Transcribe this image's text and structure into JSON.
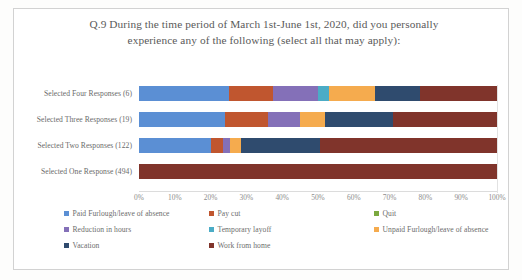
{
  "chart_data": {
    "type": "bar",
    "orientation": "horizontal",
    "stacked": true,
    "normalized_percent": true,
    "title": "Q.9 During the time period of March 1st-June 1st, 2020, did you personally experience any of the following (select all that may apply):",
    "xlabel": "",
    "ylabel": "",
    "xlim": [
      0,
      100
    ],
    "grid": false,
    "legend_position": "bottom",
    "xtick_labels": [
      "0%",
      "10%",
      "20%",
      "30%",
      "40%",
      "50%",
      "60%",
      "70%",
      "80%",
      "90%",
      "100%"
    ],
    "xtick_values": [
      0,
      10,
      20,
      30,
      40,
      50,
      60,
      70,
      80,
      90,
      100
    ],
    "categories": [
      "Selected Four Responses (6)",
      "Selected Three Responses (19)",
      "Selected Two Responses (122)",
      "Selected One Response (494)"
    ],
    "series": [
      {
        "name": "Paid Furlough/leave of absence",
        "color": "#5b8fd4",
        "values": [
          25.0,
          24.0,
          20.0,
          0.0
        ]
      },
      {
        "name": "Pay cut",
        "color": "#c0562f",
        "values": [
          12.5,
          12.0,
          3.5,
          0.0
        ]
      },
      {
        "name": "Quit",
        "color": "#7ba93f",
        "values": [
          0.0,
          0.0,
          0.0,
          0.0
        ]
      },
      {
        "name": "Reduction in hours",
        "color": "#8470b8",
        "values": [
          12.5,
          9.0,
          2.0,
          0.0
        ]
      },
      {
        "name": "Temporary layoff",
        "color": "#4bacc6",
        "values": [
          3.0,
          0.0,
          0.0,
          0.0
        ]
      },
      {
        "name": "Unpaid Furlough/leave of absence",
        "color": "#f5ab4e",
        "values": [
          13.0,
          7.0,
          3.0,
          0.0
        ]
      },
      {
        "name": "Vacation",
        "color": "#2f4b6e",
        "values": [
          12.5,
          19.0,
          22.0,
          0.0
        ]
      },
      {
        "name": "Work from home",
        "color": "#80342b",
        "values": [
          21.5,
          29.0,
          49.5,
          100.0
        ]
      }
    ]
  },
  "legend": {
    "items": [
      {
        "label": "Paid Furlough/leave of absence",
        "color": "#5b8fd4"
      },
      {
        "label": "Pay cut",
        "color": "#c0562f"
      },
      {
        "label": "Quit",
        "color": "#7ba93f"
      },
      {
        "label": "Reduction in hours",
        "color": "#8470b8"
      },
      {
        "label": "Temporary layoff",
        "color": "#4bacc6"
      },
      {
        "label": "Unpaid Furlough/leave of absence",
        "color": "#f5ab4e"
      },
      {
        "label": "Vacation",
        "color": "#2f4b6e"
      },
      {
        "label": "Work from home",
        "color": "#80342b"
      }
    ]
  }
}
